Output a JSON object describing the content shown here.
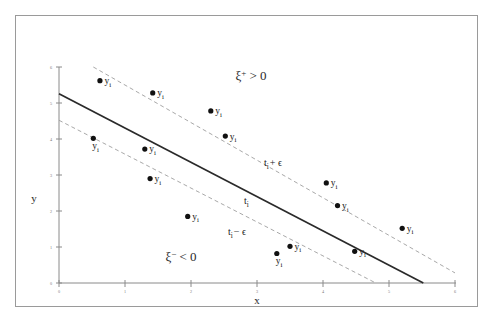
{
  "figure": {
    "title": "",
    "background_color": "#ffffff",
    "frame_color": "#9a9a9a"
  },
  "axes": {
    "x_label": "x",
    "y_label": "y",
    "x_ticks": [
      "0",
      "1",
      "2",
      "3",
      "4",
      "5",
      "6"
    ],
    "y_ticks": [
      "0",
      "1",
      "2",
      "3",
      "4",
      "5",
      "6"
    ],
    "x_range": [
      0,
      6
    ],
    "y_range": [
      0,
      6
    ]
  },
  "annotations": {
    "upper_region": "ξ",
    "upper_region_sup": "+",
    "upper_region_rel": " > 0",
    "lower_region": "ξ",
    "lower_region_sup": "−",
    "lower_region_rel": " < 0",
    "upper_line_label_main": "t",
    "upper_line_label_sub": "i",
    "upper_line_label_tail": "+ ϵ",
    "center_line_label_main": "t",
    "center_line_label_sub": "i",
    "lower_line_label_main": "t",
    "lower_line_label_sub": "i",
    "lower_line_label_tail": "− ϵ"
  },
  "chart_data": {
    "type": "scatter",
    "title": "",
    "xlabel": "x",
    "ylabel": "y",
    "xlim": [
      0,
      6
    ],
    "ylim": [
      0,
      6
    ],
    "grid": false,
    "legend": "none",
    "point_label": "y",
    "point_label_sub": "i",
    "points": [
      {
        "x": 0.62,
        "y": 5.62
      },
      {
        "x": 1.42,
        "y": 5.28
      },
      {
        "x": 2.3,
        "y": 4.78
      },
      {
        "x": 2.52,
        "y": 4.08
      },
      {
        "x": 0.52,
        "y": 4.02
      },
      {
        "x": 1.3,
        "y": 3.72
      },
      {
        "x": 1.38,
        "y": 2.9
      },
      {
        "x": 1.95,
        "y": 1.85
      },
      {
        "x": 4.05,
        "y": 2.78
      },
      {
        "x": 4.22,
        "y": 2.15
      },
      {
        "x": 5.2,
        "y": 1.52
      },
      {
        "x": 3.5,
        "y": 1.02
      },
      {
        "x": 3.3,
        "y": 0.82
      },
      {
        "x": 4.48,
        "y": 0.88
      }
    ],
    "series": [
      {
        "name": "t_i",
        "type": "line",
        "style": "solid",
        "color": "#2a2a2a",
        "x": [
          0,
          5.52
        ],
        "y": [
          5.26,
          0
        ]
      },
      {
        "name": "t_i + epsilon",
        "type": "line",
        "style": "dashed",
        "color": "#9e9e9e",
        "x": [
          0.52,
          6.0
        ],
        "y": [
          6.0,
          0.28
        ]
      },
      {
        "name": "t_i - epsilon",
        "type": "line",
        "style": "dashed",
        "color": "#9e9e9e",
        "x": [
          0,
          4.8
        ],
        "y": [
          4.52,
          0
        ]
      }
    ]
  }
}
